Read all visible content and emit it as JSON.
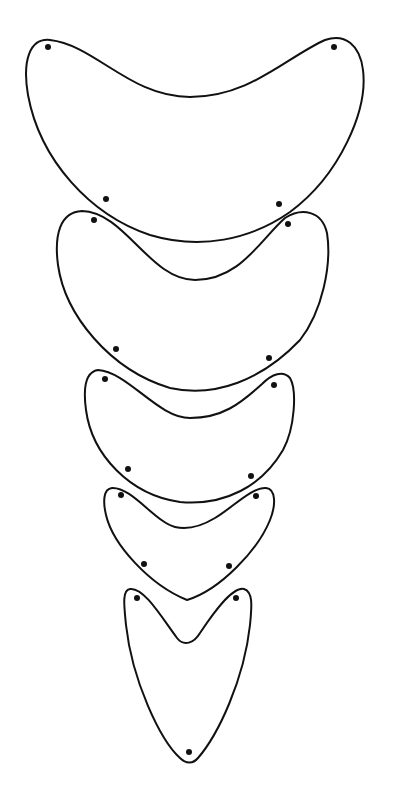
{
  "figure": {
    "width": 395,
    "height": 802,
    "background": "#ffffff",
    "stroke_color": "#111111",
    "shapes": [
      {
        "name": "crescent-plate-1",
        "path": "M 50 40 C 30 38, 22 60, 28 95 C 40 160, 90 215, 150 235 C 200 250, 250 240, 290 212 C 340 175, 368 110, 363 70 C 360 45, 345 33, 325 40 C 285 58, 250 97, 190 97 C 130 97, 95 45, 50 40 Z",
        "dots": [
          [
            48,
            47
          ],
          [
            334,
            47
          ],
          [
            106,
            199
          ],
          [
            279,
            204
          ]
        ]
      },
      {
        "name": "crescent-plate-2",
        "path": "M 82 211 C 60 212, 54 235, 58 265 C 65 315, 110 370, 170 388 C 215 398, 262 380, 300 340 C 322 312, 332 265, 327 233 C 322 211, 302 207, 285 218 C 260 240, 240 280, 195 280 C 150 280, 125 212, 82 211 Z",
        "dots": [
          [
            94,
            220
          ],
          [
            288,
            224
          ],
          [
            116,
            349
          ],
          [
            269,
            358
          ]
        ]
      },
      {
        "name": "crescent-plate-3",
        "path": "M 98 370 C 85 372, 83 388, 86 410 C 92 455, 130 495, 180 502 C 225 506, 262 486, 283 450 C 295 428, 297 390, 290 378 C 283 370, 272 374, 262 384 C 240 404, 222 418, 190 418 C 158 418, 128 372, 98 370 Z",
        "dots": [
          [
            105,
            379
          ],
          [
            274,
            385
          ],
          [
            128,
            469
          ],
          [
            251,
            476
          ]
        ]
      },
      {
        "name": "crescent-plate-4",
        "path": "M 112 488 C 103 489, 103 502, 106 515 C 113 545, 150 585, 187 600 C 220 590, 258 550, 270 520 C 276 505, 276 489, 266 488 C 252 487, 232 508, 215 518 C 200 527, 187 530, 175 527 C 155 522, 132 487, 112 488 Z",
        "dots": [
          [
            121,
            495
          ],
          [
            256,
            496
          ],
          [
            144,
            564
          ],
          [
            229,
            566
          ]
        ]
      },
      {
        "name": "crescent-plate-5",
        "path": "M 130 589 C 122 590, 124 605, 126 625 C 132 680, 160 740, 180 758 C 186 764, 193 764, 198 758 C 218 735, 244 680, 250 625 C 252 605, 253 592, 244 589 C 232 586, 212 615, 200 633 C 194 643, 184 647, 177 638 C 162 618, 144 587, 130 589 Z",
        "dots": [
          [
            137,
            598
          ],
          [
            236,
            598
          ],
          [
            189,
            752
          ]
        ]
      }
    ],
    "dot_radius": 3
  }
}
